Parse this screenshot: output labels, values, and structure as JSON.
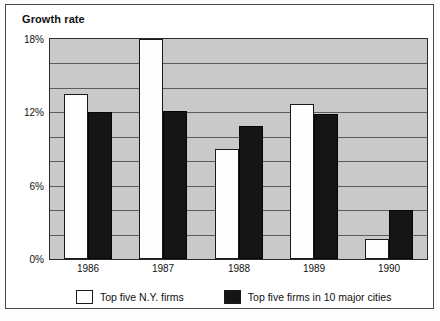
{
  "chart_data": {
    "type": "bar",
    "title": "Growth rate",
    "xlabel": "",
    "ylabel": "",
    "categories": [
      "1986",
      "1987",
      "1988",
      "1989",
      "1990"
    ],
    "series": [
      {
        "name": "Top five N.Y. firms",
        "color": "#ffffff",
        "values": [
          13.5,
          18.3,
          9.0,
          12.7,
          1.6
        ]
      },
      {
        "name": "Top five firms in 10 major cities",
        "color": "#151515",
        "values": [
          12.0,
          12.1,
          10.9,
          11.9,
          4.0
        ]
      }
    ],
    "ylim": [
      0,
      18
    ],
    "ytick_values": [
      0,
      2,
      4,
      6,
      8,
      10,
      12,
      14,
      16,
      18
    ],
    "ytick_labels": [
      "0%",
      "",
      "",
      "6%",
      "",
      "",
      "12%",
      "",
      "",
      "18%"
    ],
    "gridlines": [
      2,
      4,
      6,
      8,
      10,
      12,
      14,
      16
    ],
    "grid": true,
    "legend_position": "bottom",
    "plot_background": "#c9c9c9",
    "gridline_color": "#5d5d5d",
    "axis_color": "#2b2b2b",
    "note_clipped_series": "1987 Top five N.Y. firms bar extends to the top of the 18% axis"
  },
  "legend": {
    "items": [
      {
        "label": "Top five N.Y. firms",
        "swatch": "white-swatch"
      },
      {
        "label": "Top five firms in 10 major cities",
        "swatch": "black-swatch"
      }
    ]
  }
}
